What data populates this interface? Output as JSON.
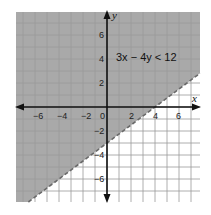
{
  "chart_data": {
    "type": "inequality-graph",
    "title": "",
    "inequality": "3x − 4y < 12",
    "boundary_line": {
      "equation": "y = 0.75x − 3",
      "style": "dashed",
      "x_intercept": 4,
      "y_intercept": -3
    },
    "shaded_region": "above boundary line",
    "xlabel": "x",
    "ylabel": "y",
    "xlim": [
      -7.5,
      7.8
    ],
    "ylim": [
      -7.8,
      7.8
    ],
    "x_ticks": [
      -6,
      -4,
      -2,
      2,
      4,
      6
    ],
    "y_ticks": [
      6,
      4,
      2,
      -2,
      -4,
      -6
    ],
    "origin_label": "0",
    "grid": true,
    "colors": {
      "shade": "#a9a9a9",
      "grid_shaded": "#7d7d7d",
      "grid_unshaded": "#c8c8c8",
      "axis": "#111111",
      "boundary": "#6a6a6a"
    }
  },
  "labels": {
    "x_axis": "x",
    "y_axis": "y",
    "origin": "0",
    "inequality": "3x − 4y < 12",
    "x_ticks": [
      "−6",
      "−4",
      "−2",
      "2",
      "4",
      "6"
    ],
    "y_ticks": [
      "6",
      "4",
      "2",
      "−2",
      "−4",
      "−6"
    ]
  }
}
